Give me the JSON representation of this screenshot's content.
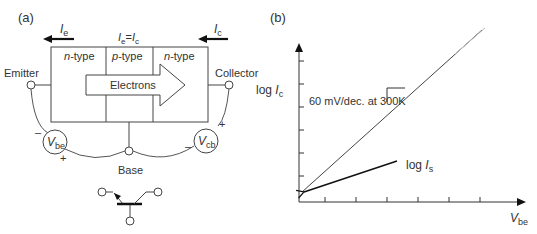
{
  "panel_a": {
    "label": "(a)",
    "current_emitter": {
      "symbol": "I",
      "sub": "e"
    },
    "current_collector": {
      "symbol": "I",
      "sub": "c"
    },
    "current_relation": {
      "lhs": "I",
      "lhs_sub": "e",
      "eq": "=",
      "rhs": "I",
      "rhs_sub": "c"
    },
    "regions": [
      {
        "italic": "n",
        "rest": "-type"
      },
      {
        "italic": "p",
        "rest": "-type"
      },
      {
        "italic": "n",
        "rest": "-type"
      }
    ],
    "arrow_label": "Electrons",
    "terminals": {
      "emitter": "Emitter",
      "collector": "Collector",
      "base": "Base"
    },
    "sources": {
      "vbe": {
        "symbol": "V",
        "sub": "be",
        "minus": "–",
        "plus": "+"
      },
      "vcb": {
        "symbol": "V",
        "sub": "cb",
        "minus": "–",
        "plus": "+"
      }
    }
  },
  "panel_b": {
    "label": "(b)",
    "ylabel": {
      "prefix": "log ",
      "symbol": "I",
      "sub": "c"
    },
    "xlabel": {
      "symbol": "V",
      "sub": "be"
    },
    "slope_annotation": "60 mV/dec. at 300K",
    "intercept_label": {
      "prefix": "log ",
      "symbol": "I",
      "sub": "s"
    }
  }
}
